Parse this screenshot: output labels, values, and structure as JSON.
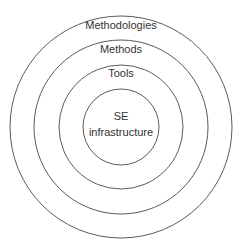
{
  "diagram": {
    "type": "concentric-layers",
    "center": {
      "x": 121,
      "y": 127
    },
    "stroke_color": "#5a5a5a",
    "text_color": "#333333",
    "layers": [
      {
        "label": "Methodologies",
        "radius": 111,
        "label_y": 26
      },
      {
        "label": "Methods",
        "radius": 87,
        "label_y": 50
      },
      {
        "label": "Tools",
        "radius": 62,
        "label_y": 74
      },
      {
        "label_line1": "SE",
        "label_line2": "infrastructure",
        "radius": 38,
        "label_y1": 117,
        "label_y2": 133
      }
    ]
  }
}
